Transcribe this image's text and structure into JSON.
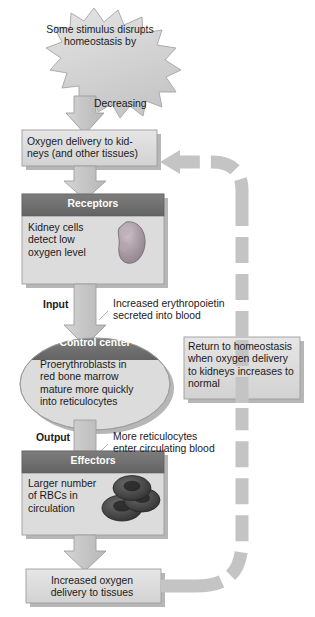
{
  "diagram": {
    "type": "homeostasis-feedback-flowchart",
    "colors": {
      "box_fill": "#d9d9d9",
      "box_fill_light": "#e3e3e3",
      "header_dark": "#6f6f6f",
      "arrow_fill": "#c9c9c9",
      "arrow_stroke": "#9a9a9a",
      "shadow": "#b3b3b3",
      "kidney": "#a99aa2",
      "rbc": "#4a4a4a",
      "text": "#1a1a1a",
      "header_text": "#ffffff"
    }
  },
  "nodes": {
    "stimulus": {
      "shape": "starburst",
      "line1": "Some stimulus disrupts",
      "line2": "homeostasis by"
    },
    "decreasing_label": "Decreasing",
    "oxygen_delivery": {
      "shape": "rect",
      "line1": "Oxygen delivery to kid-",
      "line2": "neys (and other tissues)"
    },
    "receptors": {
      "shape": "rect-with-header",
      "header": "Receptors",
      "line1": "Kidney cells",
      "line2": "detect low",
      "line3": "oxygen level",
      "icon": "kidney-icon"
    },
    "input_label": "Input",
    "input_detail": {
      "line1": "Increased erythropoietin",
      "line2": "secreted into blood"
    },
    "control_center": {
      "shape": "ellipse-with-header",
      "header": "Control center",
      "line1": "Proerythroblasts in",
      "line2": "red bone marrow",
      "line3": "mature more quickly",
      "line4": "into reticulocytes"
    },
    "output_label": "Output",
    "output_detail": {
      "line1": "More reticulocytes",
      "line2": "enter circulating blood"
    },
    "effectors": {
      "shape": "rect-with-header",
      "header": "Effectors",
      "line1": "Larger number",
      "line2": "of RBCs in",
      "line3": "circulation",
      "icon": "red-blood-cells-icon"
    },
    "increased_oxygen": {
      "shape": "rect",
      "line1": "Increased oxygen",
      "line2": "delivery to tissues"
    },
    "return_homeostasis": {
      "shape": "rect",
      "line1": "Return to homeostasis",
      "line2": "when oxygen delivery",
      "line3": "to kidneys increases to",
      "line4": "normal"
    }
  },
  "connectors": {
    "stimulus_to_oxygen": "solid-down-arrow",
    "oxygen_to_receptors": "solid-down-arrow",
    "receptors_to_control": "solid-down-arrow",
    "control_to_effectors": "solid-down-arrow",
    "effectors_to_increased": "solid-down-arrow",
    "feedback_loop": "dashed-curved-arrow-up-and-left"
  }
}
